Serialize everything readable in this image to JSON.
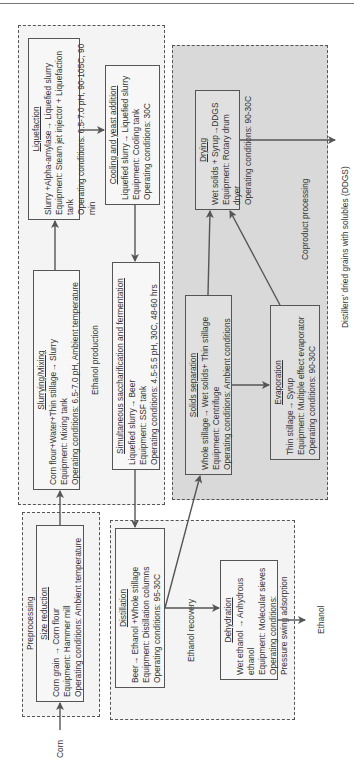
{
  "diagram": {
    "inputs": {
      "corn": "Corn"
    },
    "outputs": {
      "ethanol": "Ethanol",
      "ddgs": "Distillers' dried grains with solubles (DDGS)"
    },
    "groups": {
      "preprocessing": {
        "label": "Preprocessing",
        "size_reduction": {
          "title": "Size reduction",
          "reaction": "Corn grain → Corn flour",
          "equipment": "Equipment: Hammer mill",
          "conditions": "Operating conditions: Ambient temperature"
        }
      },
      "ethanol_production": {
        "label": "Ethanol production",
        "slurrying": {
          "title": "Slurrying/Mixing",
          "reaction": "Corn flour+Water+Thin stillage→ Slurry",
          "equipment": "Equipment: Mixing tank",
          "conditions": "Operating conditions: 6.5-7.0 pH, Ambient temperature"
        },
        "liquefaction": {
          "title": "Liquefaction",
          "reaction": "Slurry +Alpha-amylase→ Liquefied slurry",
          "equipment": "Equipment: Steam jet injector + Liquefaction tank",
          "conditions": "Operating conditions: 6.5-7.0 pH, 90-105C, 90 min"
        },
        "cooling": {
          "title": "Cooling and yeast addition",
          "reaction": "Liquefied slurry→ Liquefied slurry",
          "equipment": "Equipment: Cooling tank",
          "conditions": "Operating conditions: 30C"
        },
        "ssf": {
          "title": "Simultaneous saccharification and fermentation",
          "reaction": "Liquefied slurry→ Beer",
          "equipment": "Equipment: SSF tank",
          "conditions": "Operating conditions: 4.5-5.5 pH, 30C, 48-60 hrs"
        }
      },
      "ethanol_recovery": {
        "label": "Ethanol recovery",
        "distillation": {
          "title": "Distillation",
          "reaction": "Beer→ Ethanol +Whole stillage",
          "equipment": "Equipment: Distillation columns",
          "conditions": "Operating conditions: 95-30C"
        },
        "dehydration": {
          "title": "Dehydration",
          "reaction": "Wet ethanol → Anhydrous ethanol",
          "equipment": "Equipment: Molecular sieves",
          "conditions": "Operating conditions:  Pressure swing adsorption"
        }
      },
      "coproduct_processing": {
        "label": "Coproduct processing",
        "solids_separation": {
          "title": "Solids separation",
          "reaction": "Whole stillage→ Wet solids+ Thin stillage",
          "equipment": "Equipment: Centrifuge",
          "conditions": "Operating conditions: Ambient conditions"
        },
        "evaporation": {
          "title": "Evaporation",
          "reaction": "Thin stillage→ Syrup",
          "equipment": "Equipment: Multiple effect evaporator",
          "conditions": "Operating conditions: 90-30C"
        },
        "drying": {
          "title": "Drying",
          "reaction": "Wet solids + Syrup→DDGS",
          "equipment": "Equipment: Rotary drum dryer",
          "conditions": "Operating conditions: 90-30C"
        }
      }
    },
    "colors": {
      "coproduct_fill": "#d9d9d9",
      "line": "#555555"
    }
  }
}
